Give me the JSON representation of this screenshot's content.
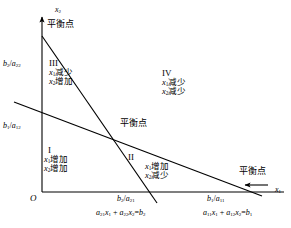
{
  "figure": {
    "type": "phase-plane-diagram",
    "background_color": "#ffffff",
    "line_color": "#000000"
  },
  "axes": {
    "origin_label": "O",
    "x_axis_label": "x",
    "x_axis_label_sub": "1",
    "y_axis_label": "x",
    "y_axis_label_sub": "2"
  },
  "intercepts": {
    "y_upper": {
      "num": "b",
      "num_sub": "2",
      "den": "a",
      "den_sub": "22"
    },
    "y_lower": {
      "num": "b",
      "num_sub": "1",
      "den": "a",
      "den_sub": "12"
    },
    "x_left": {
      "num": "b",
      "num_sub": "2",
      "den": "a",
      "den_sub": "21"
    },
    "x_right": {
      "num": "b",
      "num_sub": "1",
      "den": "a",
      "den_sub": "11"
    }
  },
  "equations": [
    {
      "id": "line-2",
      "text": "a21x1 + a22x2=b2",
      "terms": {
        "c1": "a",
        "c1_sub": "21",
        "v1": "x",
        "v1_sub": "1",
        "c2": "a",
        "c2_sub": "22",
        "v2": "x",
        "v2_sub": "2",
        "rhs": "b",
        "rhs_sub": "2"
      }
    },
    {
      "id": "line-1",
      "text": "a11x1 + a12x2=b1",
      "terms": {
        "c1": "a",
        "c1_sub": "11",
        "v1": "x",
        "v1_sub": "1",
        "c2": "a",
        "c2_sub": "12",
        "v2": "x",
        "v2_sub": "2",
        "rhs": "b",
        "rhs_sub": "1"
      }
    }
  ],
  "equilibrium_points": [
    {
      "id": "top",
      "label": "平衡点"
    },
    {
      "id": "center",
      "label": "平衡点"
    },
    {
      "id": "right",
      "label": "平衡点"
    }
  ],
  "regions": [
    {
      "id": "I",
      "numeral": "I",
      "line1_var": "x",
      "line1_sub": "1",
      "line1_text": "增加",
      "line2_var": "x",
      "line2_sub": "2",
      "line2_text": "增加"
    },
    {
      "id": "II",
      "numeral": "II",
      "line1_var": "x",
      "line1_sub": "1",
      "line1_text": "增加",
      "line2_var": "x",
      "line2_sub": "2",
      "line2_text": "减少"
    },
    {
      "id": "III",
      "numeral": "III",
      "line1_var": "x",
      "line1_sub": "1",
      "line1_text": "减少",
      "line2_var": "x",
      "line2_sub": "2",
      "line2_text": "增加"
    },
    {
      "id": "IV",
      "numeral": "IV",
      "line1_var": "x",
      "line1_sub": "1",
      "line1_text": "减少",
      "line2_var": "x",
      "line2_sub": "2",
      "line2_text": "减少"
    }
  ]
}
